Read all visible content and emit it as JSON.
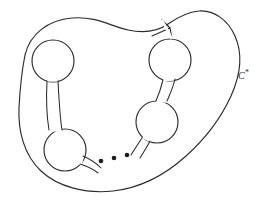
{
  "figure": {
    "background_color": "#ffffff",
    "stroke_color": "#2b2b2b",
    "dot_color": "#1c1c1c",
    "width": 263,
    "height": 205,
    "labels": [
      {
        "id": "outer-curve-label",
        "base": "C",
        "superscript": "*",
        "x": 238,
        "y": 69
      }
    ],
    "ellipsis": {
      "count": 3,
      "radius": 2.3,
      "points": [
        {
          "x": 101,
          "y": 161
        },
        {
          "x": 114,
          "y": 158
        },
        {
          "x": 127,
          "y": 155
        }
      ]
    },
    "circles": [
      {
        "id": "circle-top-left",
        "cx": 53,
        "cy": 61,
        "r": 21
      },
      {
        "id": "circle-bottom-left",
        "cx": 65,
        "cy": 150,
        "r": 21
      },
      {
        "id": "circle-top-right",
        "cx": 170,
        "cy": 60,
        "r": 21
      },
      {
        "id": "circle-bottom-right",
        "cx": 157,
        "cy": 122,
        "r": 21
      }
    ],
    "paths": {
      "outer_curve": "M 25 55 C 30 34 48 20 72 18 C 96 16 110 26 128 30 C 146 34 158 31 168 24 C 178 17 188 12 199 11 C 214 10 228 20 235 36 C 243 54 240 76 231 96 C 221 118 205 139 186 156 C 165 175 140 188 113 191 C 86 194 58 187 41 171 C 24 155 18 131 19 108 C 20 88 22 70 25 55 Z",
      "notch_left": "M 152 36 L 170 28 L 162 20",
      "notch_inner": "M 170 28 L 172 39",
      "tube_left_outer": "M 47 81 C 46 100 47 118 49 130",
      "tube_left_inner": "M 58 81 C 59 100 60 118 62 130",
      "tube_right_outer": "M 163 80 C 161 88 159 94 156 101",
      "tube_right_inner": "M 175 79 C 173 88 170 94 167 101",
      "tail_bottom_left_upper": "M 83 156 C 90 159 96 163 101 168",
      "tail_bottom_left_lower": "M 80 164 C 87 166 93 169 98 173",
      "tail_bottom_right_upper": "M 142 138 C 138 144 134 150 131 155",
      "tail_bottom_right_lower": "M 150 141 C 147 147 143 153 140 158"
    }
  }
}
